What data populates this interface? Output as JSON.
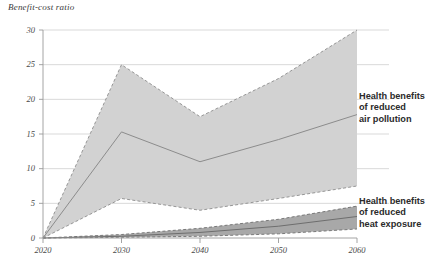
{
  "chart_data": {
    "type": "area",
    "title": "",
    "ylabel": "Benefit-cost ratio",
    "xlabel": "",
    "grid": true,
    "legend_position": "right-inline",
    "x": [
      2020,
      2030,
      2040,
      2050,
      2060
    ],
    "xlim": [
      2020,
      2060
    ],
    "ylim": [
      0,
      30
    ],
    "xticks": [
      "2020",
      "2030",
      "2040",
      "2050",
      "2060"
    ],
    "yticks": [
      "0",
      "5",
      "10",
      "15",
      "20",
      "25",
      "30"
    ],
    "series": [
      {
        "name": "Health benefits of reduced air pollution",
        "color": "#d2d2d2",
        "line_color": "#8c8c8c",
        "upper": [
          0,
          25.0,
          17.5,
          23.0,
          30.0
        ],
        "values": [
          0,
          15.3,
          11.0,
          14.2,
          17.8
        ],
        "lower": [
          0,
          5.7,
          4.0,
          5.7,
          7.5
        ]
      },
      {
        "name": "Health benefits of reduced heat exposure",
        "color": "#a8a8a8",
        "line_color": "#6e6e6e",
        "upper": [
          0,
          0.5,
          1.4,
          2.7,
          4.6
        ],
        "values": [
          0,
          0.25,
          0.8,
          1.7,
          3.1
        ],
        "lower": [
          0,
          0.1,
          0.25,
          0.6,
          1.3
        ]
      }
    ]
  },
  "axis": {
    "y_title": "Benefit-cost ratio",
    "yticks": [
      {
        "label": "30",
        "value": 30
      },
      {
        "label": "25",
        "value": 25
      },
      {
        "label": "20",
        "value": 20
      },
      {
        "label": "15",
        "value": 15
      },
      {
        "label": "10",
        "value": 10
      },
      {
        "label": "5",
        "value": 5
      },
      {
        "label": "0",
        "value": 0
      }
    ],
    "xticks": [
      {
        "label": "2020",
        "value": 2020
      },
      {
        "label": "2030",
        "value": 2030
      },
      {
        "label": "2040",
        "value": 2040
      },
      {
        "label": "2050",
        "value": 2050
      },
      {
        "label": "2060",
        "value": 2060
      }
    ]
  },
  "legend": {
    "air": {
      "line1": "Health benefits",
      "line2": "of reduced",
      "line3": "air pollution"
    },
    "heat": {
      "line1": "Health benefits",
      "line2": "of reduced",
      "line3": "heat exposure"
    }
  },
  "colors": {
    "air_band": "#d2d2d2",
    "air_line": "#8c8c8c",
    "heat_band": "#a8a8a8",
    "heat_line": "#6e6e6e",
    "grid": "#c9c9c9",
    "axis": "#9a9a9a",
    "text": "#4a4a4a",
    "legend_text": "#2b2b2b"
  }
}
